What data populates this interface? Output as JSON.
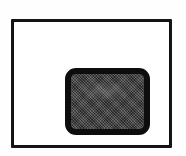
{
  "image": {
    "kind": "scanned-line-art-icon",
    "width": 186,
    "height": 156,
    "background_color": "#fefefe",
    "alt_text": "Scanned black-and-white icon: a thin rectangular frame enclosing a centered rounded rectangle filled with dithered dark gray",
    "caption": ""
  },
  "frame": {
    "name": "outer-rectangular-frame",
    "shape": "rectangle",
    "stroke_color": "#151515",
    "stroke_width_px": 3,
    "fill_color": "#ffffff",
    "x": 11,
    "y": 19,
    "width": 161,
    "height": 129
  },
  "inner": {
    "name": "rounded-rectangle-glyph",
    "shape": "rounded-rectangle",
    "stroke_color": "#0d0d0d",
    "stroke_width_px": 6,
    "corner_radius_px": 11,
    "fill_color": "#3d3d3d",
    "fill_pattern": "dithered-halftone",
    "x": 51,
    "y": 46,
    "width": 85,
    "height": 67,
    "label": ""
  }
}
